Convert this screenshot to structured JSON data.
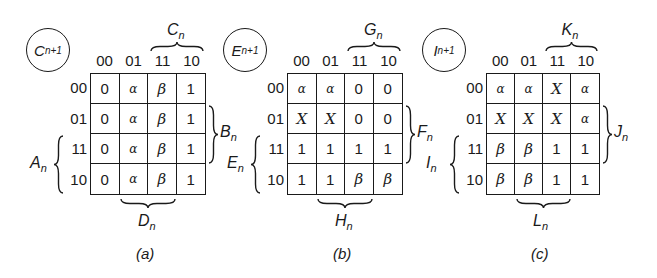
{
  "figure": {
    "type": "karnaugh_maps",
    "column_codes": [
      "00",
      "01",
      "11",
      "10"
    ],
    "row_codes": [
      "00",
      "01",
      "11",
      "10"
    ],
    "maps": [
      {
        "id": "a",
        "caption": "(a)",
        "output_var": "C",
        "output_sub": "n+1",
        "top_brace": {
          "var": "C",
          "sub": "n"
        },
        "right_brace": {
          "var": "B",
          "sub": "n"
        },
        "left_brace": {
          "var": "A",
          "sub": "n"
        },
        "bottom_brace": {
          "var": "D",
          "sub": "n"
        },
        "cells": [
          [
            "0",
            "α",
            "β",
            "1"
          ],
          [
            "0",
            "α",
            "β",
            "1"
          ],
          [
            "0",
            "α",
            "β",
            "1"
          ],
          [
            "0",
            "α",
            "β",
            "1"
          ]
        ]
      },
      {
        "id": "b",
        "caption": "(b)",
        "output_var": "E",
        "output_sub": "n+1",
        "top_brace": {
          "var": "G",
          "sub": "n"
        },
        "right_brace": {
          "var": "F",
          "sub": "n"
        },
        "left_brace": {
          "var": "E",
          "sub": "n"
        },
        "bottom_brace": {
          "var": "H",
          "sub": "n"
        },
        "cells": [
          [
            "α",
            "α",
            "0",
            "0"
          ],
          [
            "X",
            "X",
            "0",
            "0"
          ],
          [
            "1",
            "1",
            "1",
            "1"
          ],
          [
            "1",
            "1",
            "β",
            "β"
          ]
        ]
      },
      {
        "id": "c",
        "caption": "(c)",
        "output_var": "I",
        "output_sub": "n+1",
        "top_brace": {
          "var": "K",
          "sub": "n"
        },
        "right_brace": {
          "var": "J",
          "sub": "n"
        },
        "left_brace": {
          "var": "I",
          "sub": "n"
        },
        "bottom_brace": {
          "var": "L",
          "sub": "n"
        },
        "cells": [
          [
            "α",
            "α",
            "X",
            "α"
          ],
          [
            "X",
            "X",
            "X",
            "α"
          ],
          [
            "β",
            "β",
            "1",
            "1"
          ],
          [
            "β",
            "β",
            "1",
            "1"
          ]
        ]
      }
    ]
  }
}
